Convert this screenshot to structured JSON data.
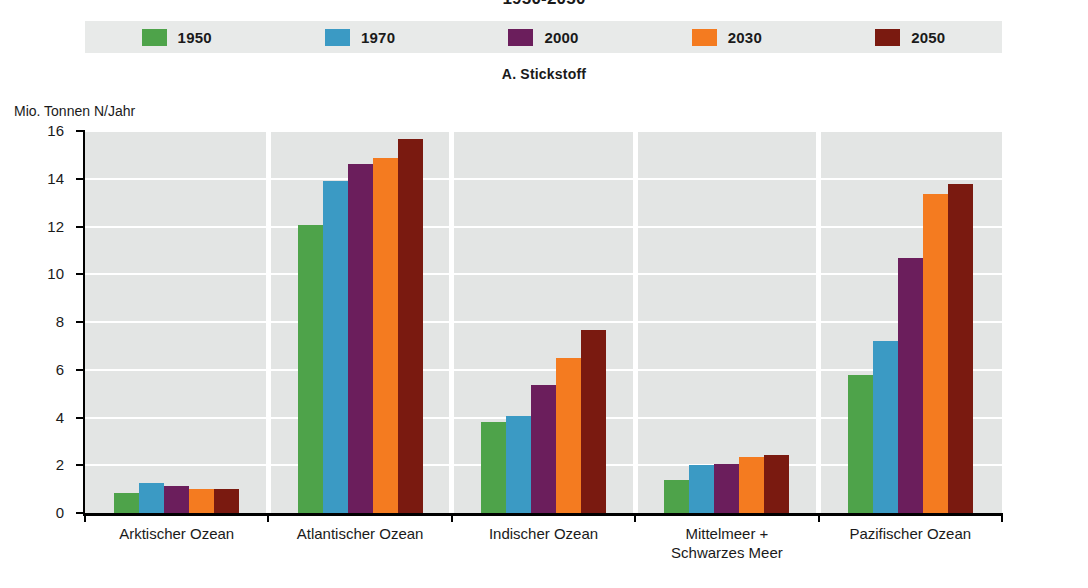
{
  "title": "1950-2050",
  "subtitle": "A. Stickstoff",
  "y_axis_unit": "Mio. Tonnen N/Jahr",
  "legend": {
    "items": [
      {
        "label": "1950",
        "color": "#4ea34a",
        "swatch_name": "legend-swatch-1950"
      },
      {
        "label": "1970",
        "color": "#3b9ac4",
        "swatch_name": "legend-swatch-1970"
      },
      {
        "label": "2000",
        "color": "#6b1e5c",
        "swatch_name": "legend-swatch-2000"
      },
      {
        "label": "2030",
        "color": "#f47b20",
        "swatch_name": "legend-swatch-2030"
      },
      {
        "label": "2050",
        "color": "#7a1a10",
        "swatch_name": "legend-swatch-2050"
      }
    ]
  },
  "y_ticks": [
    "0",
    "2",
    "4",
    "6",
    "8",
    "10",
    "12",
    "14",
    "16"
  ],
  "chart_data": {
    "type": "bar",
    "title": "1950-2050",
    "subtitle": "A. Stickstoff",
    "xlabel": "",
    "ylabel": "Mio. Tonnen N/Jahr",
    "ylim": [
      0,
      16
    ],
    "ytick_step": 2,
    "grid": true,
    "legend_position": "top",
    "categories": [
      "Arktischer Ozean",
      "Atlantischer Ozean",
      "Indischer Ozean",
      "Mittelmeer +\nSchwarzes Meer",
      "Pazifischer Ozean"
    ],
    "series": [
      {
        "name": "1950",
        "color": "#4ea34a",
        "values": [
          0.85,
          12.05,
          3.8,
          1.4,
          5.8
        ]
      },
      {
        "name": "1970",
        "color": "#3b9ac4",
        "values": [
          1.25,
          13.9,
          4.05,
          2.0,
          7.2
        ]
      },
      {
        "name": "2000",
        "color": "#6b1e5c",
        "values": [
          1.15,
          14.6,
          5.35,
          2.05,
          10.7
        ]
      },
      {
        "name": "2030",
        "color": "#f47b20",
        "values": [
          1.0,
          14.85,
          6.5,
          2.35,
          13.35
        ]
      },
      {
        "name": "2050",
        "color": "#7a1a10",
        "values": [
          1.0,
          15.65,
          7.65,
          2.45,
          13.8
        ]
      }
    ]
  },
  "colors": {
    "plot_background": "#e3e5e4",
    "gridline": "#ffffff",
    "legend_background": "#e8eae9",
    "axis": "#000000"
  }
}
